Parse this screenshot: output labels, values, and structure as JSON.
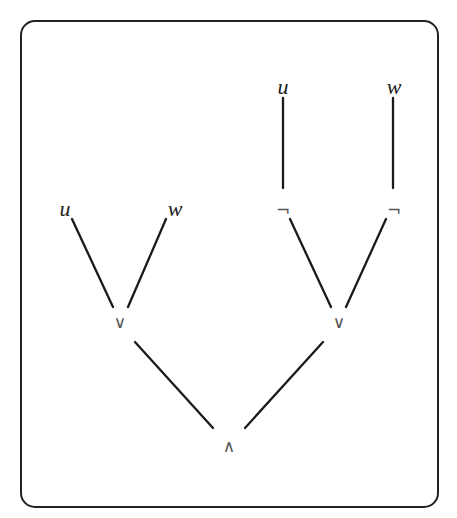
{
  "diagram": {
    "type": "formula-tree",
    "frame": {
      "x": 21,
      "y": 21,
      "width": 417,
      "height": 486,
      "radius": 14,
      "color": "#222222"
    },
    "nodes": [
      {
        "id": "and-root",
        "label": "∧",
        "kind": "operator",
        "x": 229,
        "y": 447
      },
      {
        "id": "or-left",
        "label": "∨",
        "kind": "operator",
        "x": 120,
        "y": 323
      },
      {
        "id": "or-right",
        "label": "∨",
        "kind": "operator",
        "x": 339,
        "y": 323
      },
      {
        "id": "var-u-left",
        "label": "u",
        "kind": "variable",
        "x": 65,
        "y": 211
      },
      {
        "id": "var-w-left",
        "label": "w",
        "kind": "variable",
        "x": 175,
        "y": 211
      },
      {
        "id": "not-left",
        "label": "¬",
        "kind": "operator",
        "x": 283,
        "y": 211
      },
      {
        "id": "not-right",
        "label": "¬",
        "kind": "operator",
        "x": 394,
        "y": 211
      },
      {
        "id": "var-u-top",
        "label": "u",
        "kind": "variable",
        "x": 283,
        "y": 89
      },
      {
        "id": "var-w-top",
        "label": "w",
        "kind": "variable",
        "x": 394,
        "y": 89
      }
    ],
    "edges": [
      {
        "from": "and-root",
        "to": "or-left",
        "x1": 213,
        "y1": 428,
        "x2": 135,
        "y2": 342
      },
      {
        "from": "and-root",
        "to": "or-right",
        "x1": 245,
        "y1": 428,
        "x2": 323,
        "y2": 342
      },
      {
        "from": "or-left",
        "to": "var-u-left",
        "x1": 113,
        "y1": 307,
        "x2": 72,
        "y2": 219
      },
      {
        "from": "or-left",
        "to": "var-w-left",
        "x1": 128,
        "y1": 307,
        "x2": 166,
        "y2": 219
      },
      {
        "from": "or-right",
        "to": "not-left",
        "x1": 331,
        "y1": 307,
        "x2": 290,
        "y2": 219
      },
      {
        "from": "or-right",
        "to": "not-right",
        "x1": 346,
        "y1": 307,
        "x2": 386,
        "y2": 219
      },
      {
        "from": "not-left",
        "to": "var-u-top",
        "x1": 283,
        "y1": 188,
        "x2": 283,
        "y2": 98
      },
      {
        "from": "not-right",
        "to": "var-w-top",
        "x1": 393,
        "y1": 188,
        "x2": 393,
        "y2": 98
      }
    ]
  }
}
